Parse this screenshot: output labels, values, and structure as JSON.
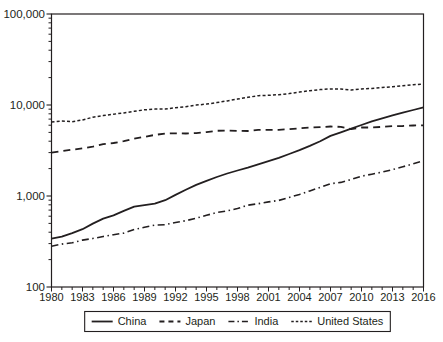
{
  "figure": {
    "background": "#ffffff",
    "line_color": "#231f20",
    "axis_color": "#231f20",
    "text_color": "#231f20"
  },
  "chart_data": {
    "type": "line",
    "title": "",
    "xlabel": "",
    "ylabel": "",
    "x_scale": "linear",
    "y_scale": "log",
    "xlim": [
      1980,
      2016
    ],
    "ylim": [
      100,
      100000
    ],
    "grid": false,
    "y_tick_labels": [
      "100",
      "1,000",
      "10,000",
      "100,000"
    ],
    "y_tick_values": [
      100,
      1000,
      10000,
      100000
    ],
    "x_tick_labels": [
      "1980",
      "1983",
      "1986",
      "1989",
      "1992",
      "1995",
      "1998",
      "2001",
      "2004",
      "2007",
      "2010",
      "2013",
      "2016"
    ],
    "x_tick_values": [
      1980,
      1983,
      1986,
      1989,
      1992,
      1995,
      1998,
      2001,
      2004,
      2007,
      2010,
      2013,
      2016
    ],
    "years": [
      1980,
      1981,
      1982,
      1983,
      1984,
      1985,
      1986,
      1987,
      1988,
      1989,
      1990,
      1991,
      1992,
      1993,
      1994,
      1995,
      1996,
      1997,
      1998,
      1999,
      2000,
      2001,
      2002,
      2003,
      2004,
      2005,
      2006,
      2007,
      2008,
      2009,
      2010,
      2011,
      2012,
      2013,
      2014,
      2015,
      2016
    ],
    "series": [
      {
        "name": "China",
        "line_style": "solid",
        "values": [
          340,
          358,
          390,
          432,
          498,
          564,
          614,
          686,
          762,
          794,
          824,
          900,
          1028,
          1170,
          1324,
          1470,
          1617,
          1767,
          1905,
          2050,
          2227,
          2412,
          2632,
          2895,
          3188,
          3552,
          4003,
          4571,
          5013,
          5485,
          6036,
          6612,
          7133,
          7687,
          8250,
          8818,
          9413
        ]
      },
      {
        "name": "Japan",
        "line_style": "dashed",
        "values": [
          3000,
          3120,
          3230,
          3340,
          3490,
          3710,
          3820,
          4000,
          4270,
          4470,
          4690,
          4850,
          4890,
          4860,
          4910,
          5040,
          5200,
          5250,
          5190,
          5180,
          5320,
          5340,
          5340,
          5420,
          5540,
          5640,
          5710,
          5810,
          5750,
          5430,
          5660,
          5660,
          5740,
          5850,
          5880,
          5950,
          5980
        ]
      },
      {
        "name": "India",
        "line_style": "dashdot",
        "values": [
          280,
          296,
          306,
          328,
          341,
          359,
          376,
          391,
          428,
          454,
          479,
          484,
          511,
          535,
          570,
          613,
          659,
          686,
          728,
          792,
          822,
          862,
          894,
          965,
          1041,
          1138,
          1243,
          1366,
          1409,
          1519,
          1650,
          1737,
          1832,
          1949,
          2093,
          2260,
          2440
        ]
      },
      {
        "name": "United States",
        "line_style": "shortdash",
        "values": [
          6500,
          6670,
          6550,
          6850,
          7350,
          7650,
          7920,
          8190,
          8530,
          8850,
          9020,
          9010,
          9330,
          9580,
          9970,
          10240,
          10630,
          11100,
          11600,
          12150,
          12650,
          12770,
          12990,
          13360,
          13870,
          14360,
          14760,
          15040,
          15010,
          14620,
          14990,
          15230,
          15570,
          15850,
          16250,
          16710,
          16970
        ]
      }
    ],
    "legend": {
      "position": "bottom-center",
      "boxed": true,
      "entries": [
        "China",
        "Japan",
        "India",
        "United States"
      ]
    }
  }
}
